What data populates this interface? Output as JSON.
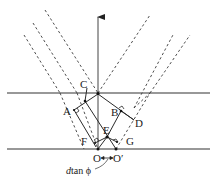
{
  "diagram": {
    "type": "thin-film-interference-geometry",
    "labels": {
      "A": "A",
      "B": "B",
      "C": "C",
      "D": "D",
      "E": "E",
      "F": "F",
      "G": "G",
      "O": "O",
      "O_prime": "O′",
      "offset_d": "d",
      "offset_rest": "tan ϕ"
    },
    "colors": {
      "line": "#2a2a2a",
      "dashed": "#3a3a3a",
      "background": "#ffffff"
    }
  }
}
